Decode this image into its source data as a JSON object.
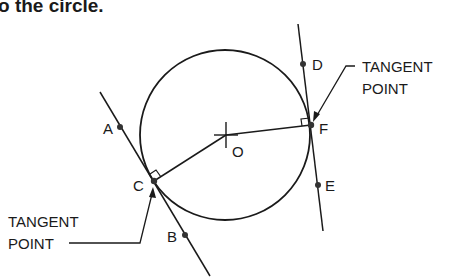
{
  "heading": {
    "text": "o the circle."
  },
  "diagram": {
    "center_label": "O",
    "points": {
      "A": "A",
      "B": "B",
      "C": "C",
      "D": "D",
      "E": "E",
      "F": "F"
    },
    "callouts": {
      "left": {
        "line1": "TANGENT",
        "line2": "POINT"
      },
      "right": {
        "line1": "TANGENT",
        "line2": "POINT"
      }
    },
    "colors": {
      "stroke": "#1a1a1a",
      "point": "#333333",
      "background": "#ffffff"
    }
  }
}
